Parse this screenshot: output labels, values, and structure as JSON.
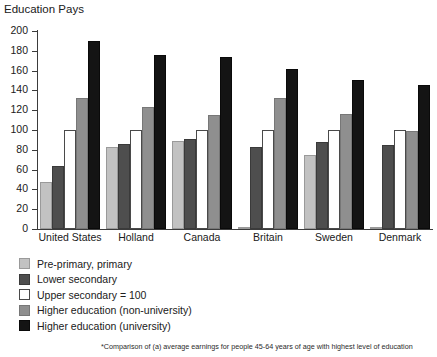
{
  "chart_data": {
    "type": "bar",
    "title": "Education Pays",
    "xlabel": "",
    "ylabel": "",
    "ylim": [
      0,
      200
    ],
    "ytick_step": 20,
    "yticks": [
      0,
      20,
      40,
      60,
      80,
      100,
      120,
      140,
      160,
      180,
      200
    ],
    "grid": false,
    "legend_position": "below-left",
    "categories": [
      "United States",
      "Holland",
      "Canada",
      "Britain",
      "Sweden",
      "Denmark"
    ],
    "series": [
      {
        "name": "Pre-primary, primary",
        "color": "#c2c2c2",
        "values": [
          47,
          83,
          89,
          2,
          75,
          2
        ]
      },
      {
        "name": "Lower secondary",
        "color": "#4e4e4e",
        "values": [
          64,
          86,
          91,
          83,
          88,
          85
        ]
      },
      {
        "name": "Upper secondary = 100",
        "color": "#ffffff",
        "values": [
          100,
          100,
          100,
          100,
          100,
          100
        ]
      },
      {
        "name": "Higher education (non-university)",
        "color": "#8f8f8f",
        "values": [
          132,
          123,
          115,
          132,
          116,
          99
        ]
      },
      {
        "name": "Higher education (university)",
        "color": "#141414",
        "values": [
          190,
          176,
          174,
          162,
          151,
          145
        ]
      }
    ],
    "annotations": [
      "*Comparison of (a) average earnings for people 45-64 years of age with highest level of education"
    ]
  },
  "footnote": "*Comparison of (a) average earnings for people 45-64 years of age with highest level of education",
  "legend": [
    {
      "label": "Pre-primary, primary",
      "swatch": "sw-1"
    },
    {
      "label": "Lower secondary",
      "swatch": "sw-2"
    },
    {
      "label": "Upper secondary = 100",
      "swatch": "sw-3"
    },
    {
      "label": "Higher education (non-university)",
      "swatch": "sw-4"
    },
    {
      "label": "Higher education (university)",
      "swatch": "sw-5"
    }
  ]
}
